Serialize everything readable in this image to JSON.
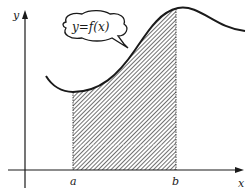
{
  "diagram": {
    "curve_label": "y=f(x)",
    "axes": {
      "x_label": "x",
      "y_label": "y"
    },
    "bounds": {
      "lower": "a",
      "upper": "b"
    },
    "colors": {
      "ink": "#1a1a1a",
      "background": "#ffffff",
      "hatch": "#333333"
    }
  }
}
